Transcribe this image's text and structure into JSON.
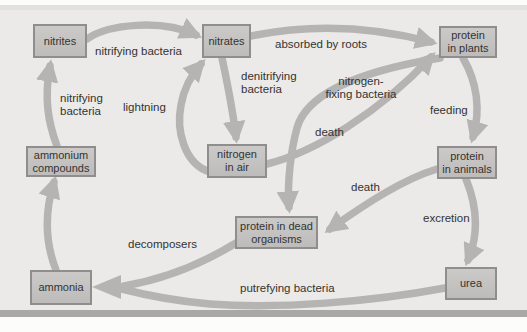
{
  "figure": {
    "name": "nitrogen-cycle-diagram",
    "width": 527,
    "height": 332
  },
  "palette": {
    "page_bg": "#fcfcfb",
    "panel_bg": "#ebeae8",
    "panel_top_line": "#e2e1df",
    "panel_bottom_bar": "#a9a8a6",
    "box_fill_top": "#cbcac8",
    "box_fill_bottom": "#bdbcba",
    "box_border": "#8f8e8c",
    "arrow": "#b5b4b2",
    "text": "#333333"
  },
  "nodes": [
    {
      "id": "nitrites",
      "lines": [
        "nitrites"
      ],
      "x": 33,
      "y": 24,
      "w": 54,
      "h": 34
    },
    {
      "id": "nitrates",
      "lines": [
        "nitrates"
      ],
      "x": 202,
      "y": 24,
      "w": 49,
      "h": 34
    },
    {
      "id": "protein-in-plants",
      "lines": [
        "protein",
        "in plants"
      ],
      "x": 439,
      "y": 26,
      "w": 58,
      "h": 32
    },
    {
      "id": "ammonium-compounds",
      "lines": [
        "ammonium",
        "compounds"
      ],
      "x": 26,
      "y": 146,
      "w": 70,
      "h": 31
    },
    {
      "id": "nitrogen-in-air",
      "lines": [
        "nitrogen",
        "in air"
      ],
      "x": 207,
      "y": 144,
      "w": 60,
      "h": 34
    },
    {
      "id": "protein-in-animals",
      "lines": [
        "protein",
        "in animals"
      ],
      "x": 437,
      "y": 146,
      "w": 60,
      "h": 33
    },
    {
      "id": "protein-in-dead-organisms",
      "lines": [
        "protein in dead",
        "organisms"
      ],
      "x": 235,
      "y": 216,
      "w": 83,
      "h": 33
    },
    {
      "id": "ammonia",
      "lines": [
        "ammonia"
      ],
      "x": 30,
      "y": 270,
      "w": 62,
      "h": 35
    },
    {
      "id": "urea",
      "lines": [
        "urea"
      ],
      "x": 445,
      "y": 267,
      "w": 52,
      "h": 33
    }
  ],
  "labels": [
    {
      "id": "nitrifying-bacteria-top",
      "lines": [
        "nitrifying bacteria"
      ],
      "x": 95,
      "y": 45,
      "align": "left"
    },
    {
      "id": "nitrifying-bacteria-left",
      "lines": [
        "nitrifying",
        "bacteria"
      ],
      "x": 60,
      "y": 92,
      "align": "left"
    },
    {
      "id": "lightning",
      "lines": [
        "lightning"
      ],
      "x": 123,
      "y": 101,
      "align": "left"
    },
    {
      "id": "denitrifying-bacteria",
      "lines": [
        "denitrifying",
        "bacteria"
      ],
      "x": 241,
      "y": 70,
      "align": "left"
    },
    {
      "id": "absorbed-by-roots",
      "lines": [
        "absorbed by roots"
      ],
      "x": 275,
      "y": 38,
      "align": "left"
    },
    {
      "id": "nitrogen-fixing-bacteria",
      "lines": [
        "nitrogen-",
        "fixing bacteria"
      ],
      "x": 325,
      "y": 75,
      "align": "center",
      "w": 72
    },
    {
      "id": "feeding",
      "lines": [
        "feeding"
      ],
      "x": 430,
      "y": 104,
      "align": "left"
    },
    {
      "id": "death-upper",
      "lines": [
        "death"
      ],
      "x": 315,
      "y": 126,
      "align": "left"
    },
    {
      "id": "death-lower",
      "lines": [
        "death"
      ],
      "x": 351,
      "y": 181,
      "align": "left"
    },
    {
      "id": "excretion",
      "lines": [
        "excretion"
      ],
      "x": 423,
      "y": 212,
      "align": "left"
    },
    {
      "id": "decomposers",
      "lines": [
        "decomposers"
      ],
      "x": 128,
      "y": 238,
      "align": "left"
    },
    {
      "id": "putrefying-bacteria",
      "lines": [
        "putrefying bacteria"
      ],
      "x": 240,
      "y": 282,
      "align": "left"
    }
  ],
  "arrows": [
    {
      "id": "nitrites-to-nitrates",
      "d": "M 87,39 C 108,24 162,19 196,35",
      "head": true
    },
    {
      "id": "ammonium-to-nitrites",
      "d": "M 57,146 C 48,122 44,98 50,66",
      "head": true
    },
    {
      "id": "ammonia-to-ammonium",
      "d": "M 56,270 C 45,242 44,214 54,182",
      "head": true
    },
    {
      "id": "nitrates-to-plants",
      "d": "M 251,36 C 310,24 370,26 431,42",
      "head": true
    },
    {
      "id": "nitrates-to-air",
      "d": "M 222,58 C 228,86 233,112 236,137",
      "head": true
    },
    {
      "id": "air-to-nitrates",
      "d": "M 210,172 C 184,164 176,130 181,105 C 184,88 192,74 201,64",
      "head": true
    },
    {
      "id": "air-to-plants",
      "d": "M 267,164 C 315,152 380,112 431,57",
      "head": true
    },
    {
      "id": "plants-to-dead-organisms",
      "d": "M 440,58 C 378,68 308,88 297,128 C 291,150 287,182 289,207",
      "head": true
    },
    {
      "id": "animals-to-dead-organisms",
      "d": "M 437,169 C 404,179 368,202 330,229",
      "head": true
    },
    {
      "id": "plants-to-animals",
      "d": "M 463,58 C 477,82 481,110 473,137",
      "head": true
    },
    {
      "id": "animals-to-urea",
      "d": "M 466,179 C 477,206 479,234 468,260",
      "head": true
    },
    {
      "id": "urea-to-ammonia",
      "d": "M 445,288 C 370,302 280,309 210,304 C 175,301 145,295 122,289",
      "head": false
    },
    {
      "id": "dead-organisms-to-ammonia",
      "d": "M 236,243 C 205,262 165,279 124,286",
      "head": false
    }
  ],
  "merge_arrowhead": {
    "id": "ammonia-merge-arrowhead",
    "points": "92,287 121,275 121,299"
  }
}
